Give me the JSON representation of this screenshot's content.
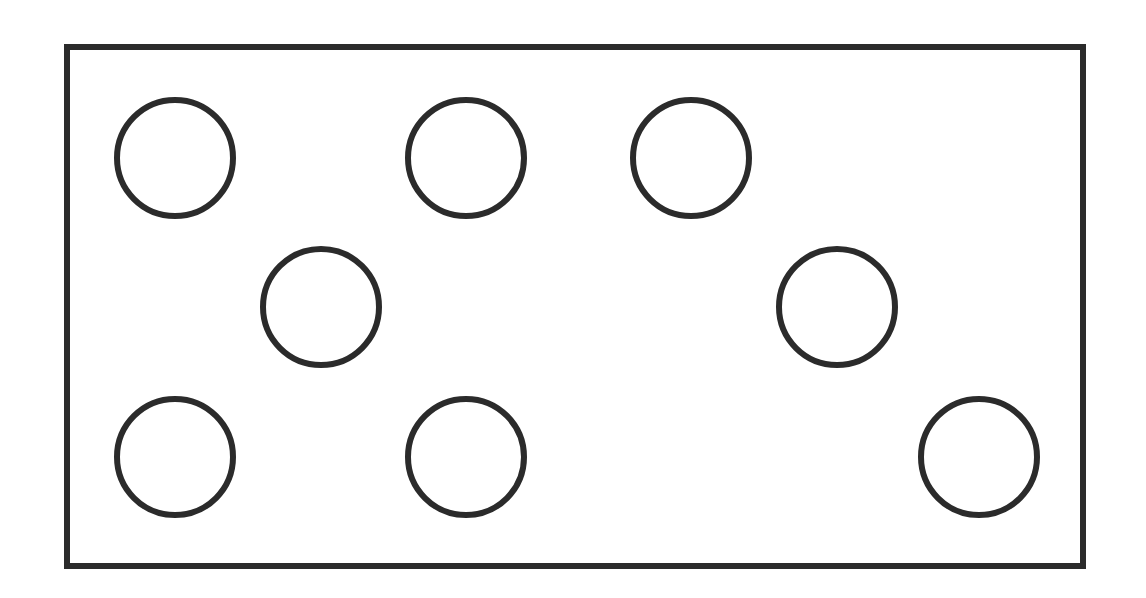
{
  "diagram": {
    "frame": {
      "left": 64,
      "top": 44,
      "right": 1086,
      "bottom": 569,
      "stroke_color": "#2b2b2b"
    },
    "circle_radius": 60,
    "circles": [
      {
        "id": 1,
        "cx": 174,
        "cy": 157
      },
      {
        "id": 2,
        "cx": 465,
        "cy": 157
      },
      {
        "id": 3,
        "cx": 690,
        "cy": 157
      },
      {
        "id": 4,
        "cx": 320,
        "cy": 306
      },
      {
        "id": 5,
        "cx": 836,
        "cy": 306
      },
      {
        "id": 6,
        "cx": 174,
        "cy": 456
      },
      {
        "id": 7,
        "cx": 465,
        "cy": 456
      },
      {
        "id": 8,
        "cx": 978,
        "cy": 456
      }
    ]
  }
}
